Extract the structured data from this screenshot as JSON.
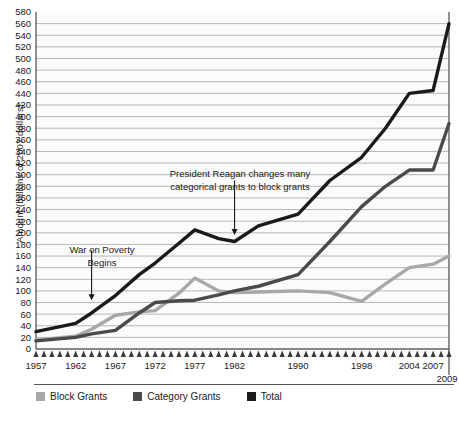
{
  "chart_data": {
    "type": "line",
    "title": "",
    "xlabel": "",
    "ylabel": "Amount (billions of 2007 dollars)",
    "ylim": [
      0,
      580
    ],
    "ytick_step": 20,
    "yticks": [
      0,
      20,
      40,
      60,
      80,
      100,
      120,
      140,
      160,
      180,
      200,
      220,
      240,
      260,
      280,
      300,
      320,
      340,
      360,
      380,
      400,
      420,
      440,
      460,
      480,
      500,
      520,
      540,
      560,
      580
    ],
    "xlim": [
      1957,
      2009
    ],
    "xtick_labels": [
      "1957",
      "1962",
      "1967",
      "1972",
      "1977",
      "1982",
      "1990",
      "1998",
      "2004",
      "2007",
      "2009"
    ],
    "xtick_years": [
      1957,
      1962,
      1967,
      1972,
      1977,
      1982,
      1990,
      1998,
      2004,
      2007,
      2009
    ],
    "grid": "horizontal",
    "legend_position": "bottom",
    "x": [
      1957,
      1962,
      1964,
      1967,
      1970,
      1972,
      1975,
      1977,
      1980,
      1982,
      1985,
      1990,
      1994,
      1998,
      2001,
      2004,
      2007,
      2009
    ],
    "series": [
      {
        "name": "Block Grants",
        "color": "#a8a8a8",
        "values": [
          15,
          22,
          34,
          58,
          64,
          66,
          96,
          122,
          100,
          97,
          98,
          100,
          97,
          82,
          112,
          140,
          146,
          160
        ]
      },
      {
        "name": "Category Grants",
        "color": "#4a4a4a",
        "values": [
          14,
          20,
          26,
          32,
          62,
          80,
          83,
          84,
          93,
          100,
          108,
          128,
          185,
          245,
          280,
          308,
          308,
          388
        ]
      },
      {
        "name": "Total",
        "color": "#1a1a1a",
        "values": [
          30,
          44,
          62,
          92,
          128,
          148,
          182,
          205,
          190,
          185,
          212,
          232,
          290,
          330,
          380,
          440,
          445,
          560
        ]
      }
    ],
    "annotations": [
      {
        "id": "war-on-poverty",
        "text": "War on Poverty\nBegins",
        "target_year": 1964,
        "target_value": 84
      },
      {
        "id": "reagan-block-grants",
        "text": "President Reagan changes many\ncategorical grants to block grants",
        "target_year": 1982,
        "target_value": 190
      }
    ]
  },
  "legend": {
    "items": [
      {
        "label": "Block Grants",
        "color": "#a8a8a8"
      },
      {
        "label": "Category Grants",
        "color": "#4a4a4a"
      },
      {
        "label": "Total",
        "color": "#1a1a1a"
      }
    ]
  },
  "axis": {
    "y_title": "Amount (billions of 2007 dollars)",
    "end_year_label": "2009"
  }
}
